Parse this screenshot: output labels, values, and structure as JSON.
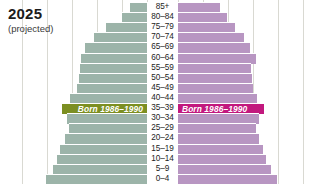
{
  "header": {
    "title": "2025",
    "subtitle": "(projected)"
  },
  "annotations": {
    "left_band_label": "Born 1986–1990",
    "right_band_label": "Born 1986–1990"
  },
  "colors": {
    "male_bar": "#9cb4a9",
    "female_bar": "#b896c2",
    "male_highlight": "#7c8f22",
    "female_highlight": "#c2187e",
    "gridline": "#d9d9d2",
    "background": "#ffffff",
    "text": "#1c1c1c"
  },
  "chart_data": {
    "type": "bar",
    "subtype": "population-pyramid",
    "title": "2025",
    "subtitle": "(projected)",
    "xlabel": "",
    "ylabel": "Age group",
    "grid": true,
    "legend_position": "none",
    "orientation": "horizontal",
    "categories": [
      "85+",
      "80–84",
      "75–79",
      "70–74",
      "65–69",
      "60–64",
      "55–59",
      "50–54",
      "45–49",
      "40–44",
      "35–39",
      "30–34",
      "25–29",
      "20–24",
      "15–19",
      "10–14",
      "5–9",
      "0–4"
    ],
    "highlighted_category": "35–39",
    "axis_tick_spacing_px": 25,
    "series": [
      {
        "name": "Male",
        "side": "left",
        "color": "#9cb4a9",
        "highlight_color": "#7c8f22",
        "values": [
          17,
          25,
          41,
          53,
          62,
          66,
          67,
          68,
          70,
          77,
          85,
          80,
          78,
          82,
          87,
          90,
          94,
          101
        ]
      },
      {
        "name": "Female",
        "side": "right",
        "color": "#b896c2",
        "highlight_color": "#c2187e",
        "values": [
          42,
          49,
          57,
          66,
          72,
          78,
          73,
          74,
          75,
          79,
          86,
          81,
          78,
          81,
          85,
          88,
          93,
          99
        ]
      }
    ]
  }
}
